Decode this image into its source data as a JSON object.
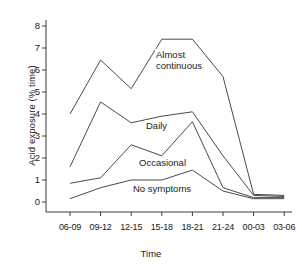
{
  "chart_data": {
    "type": "line",
    "title": "",
    "xlabel": "Time",
    "ylabel": "Acid exposure (% time)",
    "categories": [
      "06-09",
      "09-12",
      "12-15",
      "15-18",
      "18-21",
      "21-24",
      "00-03",
      "03-06"
    ],
    "ylim": [
      0,
      8
    ],
    "yticks": [
      0,
      1,
      2,
      3,
      4,
      5,
      6,
      7,
      8
    ],
    "ytick_labels": [
      "0",
      "1",
      "2",
      "3",
      "4",
      "5",
      "6",
      "7",
      "8"
    ],
    "grid": false,
    "legend_position": "inline-annotations",
    "series": [
      {
        "name": "Almost continuous",
        "label": "Almost\ncontinuous",
        "values": [
          4.0,
          6.45,
          5.15,
          7.4,
          7.4,
          5.7,
          0.35,
          0.3
        ]
      },
      {
        "name": "Daily",
        "label": "Daily",
        "values": [
          1.6,
          4.55,
          3.6,
          3.9,
          4.1,
          2.1,
          0.3,
          0.25
        ]
      },
      {
        "name": "Occasional",
        "label": "Occasional",
        "values": [
          0.85,
          1.1,
          2.6,
          2.1,
          3.65,
          0.65,
          0.2,
          0.2
        ]
      },
      {
        "name": "No symptoms",
        "label": "No symptoms",
        "values": [
          0.15,
          0.65,
          1.0,
          1.0,
          1.45,
          0.5,
          0.15,
          0.15
        ]
      }
    ],
    "annotations": [
      {
        "text": "Almost",
        "series": "Almost continuous",
        "x": 155,
        "y": 49
      },
      {
        "text": "continuous",
        "series": "Almost continuous",
        "x": 155,
        "y": 60
      },
      {
        "text": "Daily",
        "series": "Daily",
        "x": 145,
        "y": 120
      },
      {
        "text": "Occasional",
        "series": "Occasional",
        "x": 138,
        "y": 157
      },
      {
        "text": "No symptoms",
        "series": "No symptoms",
        "x": 132,
        "y": 183
      }
    ],
    "colors": {
      "line": "#4a4a4a",
      "axis": "#3a3a3a",
      "text": "#1a1a1a",
      "background": "#ffffff"
    }
  }
}
